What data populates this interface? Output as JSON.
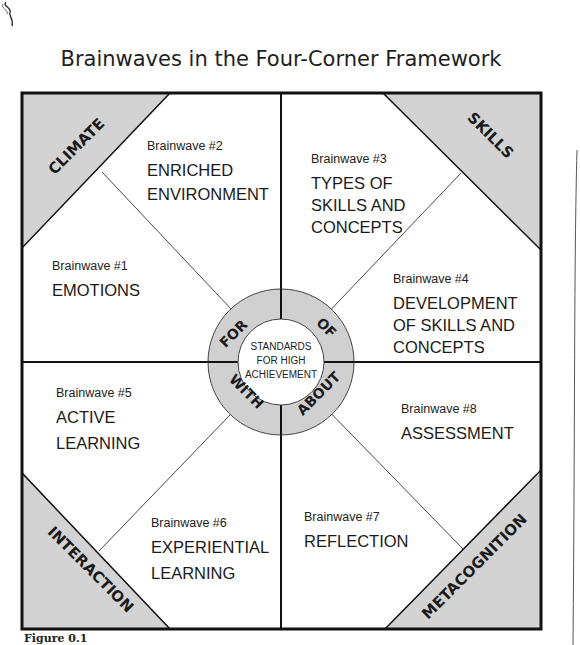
{
  "title": "Brainwaves in the Four-Corner Framework",
  "caption": "Figure 0.1",
  "colors": {
    "corner_fill": "#d3d3d3",
    "ring_fill": "#d0d0d0",
    "border": "#111111",
    "background": "#ffffff"
  },
  "corners": {
    "top_left": "CLIMATE",
    "top_right": "SKILLS",
    "bottom_left": "INTERACTION",
    "bottom_right": "METACOGNITION"
  },
  "ring": {
    "top_left": "FOR",
    "top_right": "OF",
    "bottom_left": "WITH",
    "bottom_right": "ABOUT"
  },
  "center": {
    "line1": "STANDARDS",
    "line2": "FOR HIGH",
    "line3": "ACHIEVEMENT"
  },
  "brainwaves": [
    {
      "label": "Brainwave #1",
      "lines": [
        "EMOTIONS"
      ]
    },
    {
      "label": "Brainwave #2",
      "lines": [
        "ENRICHED",
        "ENVIRONMENT"
      ]
    },
    {
      "label": "Brainwave #3",
      "lines": [
        "TYPES OF",
        "SKILLS AND",
        "CONCEPTS"
      ]
    },
    {
      "label": "Brainwave #4",
      "lines": [
        "DEVELOPMENT",
        "OF SKILLS AND",
        "CONCEPTS"
      ]
    },
    {
      "label": "Brainwave #5",
      "lines": [
        "ACTIVE",
        "LEARNING"
      ]
    },
    {
      "label": "Brainwave #6",
      "lines": [
        "EXPERIENTIAL",
        "LEARNING"
      ]
    },
    {
      "label": "Brainwave #7",
      "lines": [
        "REFLECTION"
      ]
    },
    {
      "label": "Brainwave #8",
      "lines": [
        "ASSESSMENT"
      ]
    }
  ]
}
